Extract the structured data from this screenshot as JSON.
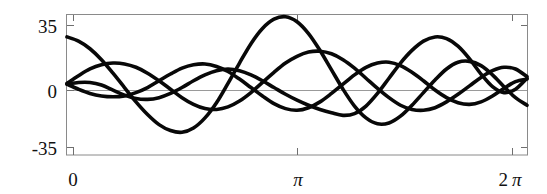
{
  "chart_data": {
    "type": "line",
    "title": "",
    "subtitle": "",
    "xlabel": "",
    "ylabel": "",
    "xlim": [
      0,
      6.283185307179586
    ],
    "ylim": [
      -42,
      41
    ],
    "grid": false,
    "legend": null,
    "x_ticks": [
      {
        "value": 0,
        "label": "0"
      },
      {
        "value": 3.141592653589793,
        "label": "π"
      },
      {
        "value": 6.283185307179586,
        "label": "2π"
      }
    ],
    "y_ticks": [
      {
        "value": 35,
        "label": "35"
      },
      {
        "value": 0,
        "label": "0"
      },
      {
        "value": -35,
        "label": "-35"
      }
    ],
    "zero_line": 0,
    "frame": true,
    "series": [
      {
        "name": "curve-1",
        "color": "#080808",
        "x": [
          0.0,
          0.157,
          0.314,
          0.471,
          0.628,
          0.785,
          0.942,
          1.1,
          1.257,
          1.414,
          1.571,
          1.728,
          1.885,
          2.042,
          2.199,
          2.356,
          2.513,
          2.67,
          2.827,
          2.985,
          3.142,
          3.299,
          3.456,
          3.613,
          3.77,
          3.927,
          4.084,
          4.241,
          4.398,
          4.555,
          4.712,
          4.869,
          5.027,
          5.184,
          5.341,
          5.498,
          5.655,
          5.812,
          5.969,
          6.126,
          6.283
        ],
        "y": [
          28.0,
          25.5,
          21.0,
          14.5,
          6.5,
          -2.0,
          -10.5,
          -18.0,
          -24.0,
          -27.5,
          -28.5,
          -26.0,
          -20.0,
          -11.0,
          0.5,
          12.5,
          24.0,
          33.0,
          38.5,
          40.0,
          37.0,
          30.0,
          20.0,
          8.5,
          -3.0,
          -13.0,
          -20.0,
          -23.5,
          -23.0,
          -19.0,
          -12.5,
          -5.0,
          2.5,
          9.0,
          13.0,
          13.5,
          11.0,
          5.5,
          -1.5,
          -8.0,
          -12.5
        ]
      },
      {
        "name": "curve-2",
        "color": "#080808",
        "x": [
          0.0,
          0.157,
          0.314,
          0.471,
          0.628,
          0.785,
          0.942,
          1.1,
          1.257,
          1.414,
          1.571,
          1.728,
          1.885,
          2.042,
          2.199,
          2.356,
          2.513,
          2.67,
          2.827,
          2.985,
          3.142,
          3.299,
          3.456,
          3.613,
          3.77,
          3.927,
          4.084,
          4.241,
          4.398,
          4.555,
          4.712,
          4.869,
          5.027,
          5.184,
          5.341,
          5.498,
          5.655,
          5.812,
          5.969,
          6.126,
          6.283
        ],
        "y": [
          0.5,
          5.0,
          9.0,
          11.5,
          12.5,
          12.0,
          10.0,
          6.5,
          2.0,
          -3.0,
          -8.0,
          -12.0,
          -14.5,
          -15.0,
          -13.5,
          -10.0,
          -5.0,
          1.0,
          7.0,
          12.5,
          16.5,
          19.0,
          19.5,
          18.0,
          14.5,
          9.5,
          3.5,
          -2.5,
          -8.0,
          -12.5,
          -15.0,
          -15.5,
          -14.0,
          -10.5,
          -6.0,
          -1.0,
          4.0,
          8.0,
          10.0,
          9.0,
          4.5
        ]
      },
      {
        "name": "curve-3",
        "color": "#080808",
        "x": [
          0.0,
          0.157,
          0.314,
          0.471,
          0.628,
          0.785,
          0.942,
          1.1,
          1.257,
          1.414,
          1.571,
          1.728,
          1.885,
          2.042,
          2.199,
          2.356,
          2.513,
          2.67,
          2.827,
          2.985,
          3.142,
          3.299,
          3.456,
          3.613,
          3.77,
          3.927,
          4.084,
          4.241,
          4.398,
          4.555,
          4.712,
          4.869,
          5.027,
          5.184,
          5.341,
          5.498,
          5.655,
          5.812,
          5.969,
          6.126,
          6.283
        ],
        "y": [
          0.0,
          -3.0,
          -5.5,
          -7.0,
          -7.5,
          -7.0,
          -5.0,
          -2.0,
          2.0,
          6.0,
          9.5,
          11.5,
          12.0,
          10.5,
          7.5,
          3.0,
          -2.0,
          -7.0,
          -11.5,
          -14.5,
          -15.5,
          -14.0,
          -10.5,
          -5.5,
          0.0,
          5.5,
          10.0,
          12.5,
          13.0,
          11.0,
          7.0,
          2.0,
          -3.5,
          -8.0,
          -11.0,
          -12.0,
          -10.5,
          -7.0,
          -2.5,
          1.5,
          3.0
        ]
      },
      {
        "name": "curve-4",
        "color": "#080808",
        "x": [
          0.0,
          0.157,
          0.314,
          0.471,
          0.628,
          0.785,
          0.942,
          1.1,
          1.257,
          1.414,
          1.571,
          1.728,
          1.885,
          2.042,
          2.199,
          2.356,
          2.513,
          2.67,
          2.827,
          2.985,
          3.142,
          3.299,
          3.456,
          3.613,
          3.77,
          3.927,
          4.084,
          4.241,
          4.398,
          4.555,
          4.712,
          4.869,
          5.027,
          5.184,
          5.341,
          5.498,
          5.655,
          5.812,
          5.969,
          6.126,
          6.283
        ],
        "y": [
          0.0,
          1.0,
          1.0,
          -0.5,
          -3.5,
          -6.5,
          -8.5,
          -9.0,
          -8.0,
          -5.5,
          -2.0,
          2.0,
          5.5,
          8.0,
          9.0,
          8.0,
          5.5,
          2.0,
          -2.0,
          -6.0,
          -9.5,
          -12.5,
          -15.0,
          -17.0,
          -18.5,
          -17.5,
          -13.0,
          -5.5,
          3.5,
          12.5,
          20.0,
          25.5,
          28.0,
          27.0,
          22.5,
          15.0,
          6.0,
          -1.5,
          -5.0,
          -3.0,
          3.5
        ]
      }
    ]
  },
  "axes": {
    "y_label_top": "35",
    "y_label_mid": "0",
    "y_label_bottom": "-35",
    "x_label_left": "0",
    "x_label_mid": "π",
    "x_label_right_num": "2",
    "x_label_right_sym": "π"
  }
}
